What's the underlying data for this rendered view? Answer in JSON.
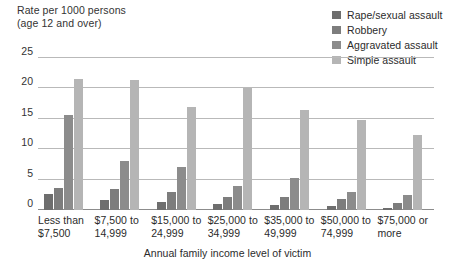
{
  "chart_data": {
    "type": "bar",
    "title": "",
    "ylabel": "Rate per 1000 persons\n(age 12 and over)",
    "xlabel": "Annual family income level of victim",
    "ylim": [
      0,
      25
    ],
    "yticks": [
      0,
      5,
      10,
      15,
      20,
      25
    ],
    "grid": true,
    "legend_position": "top-right",
    "categories": [
      "Less than\n$7,500",
      "$7,500 to\n14,999",
      "$15,000 to\n24,999",
      "$25,000 to\n34,999",
      "$35,000 to\n49,999",
      "$50,000 to\n74,999",
      "$75,000 or\nmore"
    ],
    "series": [
      {
        "name": "Rape/sexual assault",
        "color": "#6e6e6e",
        "values": [
          2.7,
          1.6,
          1.3,
          1.0,
          0.9,
          0.6,
          0.4
        ]
      },
      {
        "name": "Robbery",
        "color": "#7d7d7d",
        "values": [
          3.6,
          3.5,
          3.0,
          2.1,
          2.2,
          1.8,
          1.2
        ]
      },
      {
        "name": "Aggravated assault",
        "color": "#8c8c8c",
        "values": [
          15.6,
          8.0,
          7.1,
          4.0,
          5.3,
          2.9,
          2.5
        ]
      },
      {
        "name": "Simple assault",
        "color": "#b5b5b5",
        "values": [
          21.5,
          21.4,
          16.9,
          20.0,
          16.4,
          14.8,
          12.3
        ]
      }
    ]
  },
  "legend": {
    "items": [
      {
        "label": "Rape/sexual assault",
        "color": "#6e6e6e"
      },
      {
        "label": "Robbery",
        "color": "#7d7d7d"
      },
      {
        "label": "Aggravated assault",
        "color": "#8c8c8c"
      },
      {
        "label": "Simple assault",
        "color": "#b5b5b5"
      }
    ]
  },
  "axes": {
    "y_title": "Rate per 1000 persons\n(age 12 and over)",
    "x_title": "Annual family income level of victim",
    "y_tick_labels": [
      "0",
      "5",
      "10",
      "15",
      "20",
      "25"
    ]
  }
}
